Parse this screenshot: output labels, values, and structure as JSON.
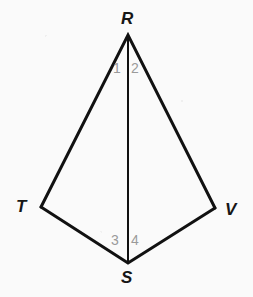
{
  "figure": {
    "background_color": "#fafafa",
    "stroke_color": "#111111",
    "angle_label_color": "#9a9a9a",
    "vertex_label_color": "#161616",
    "stroke_width": 3,
    "diagonal_stroke_width": 2,
    "vertices": [
      {
        "name": "R",
        "label": "R",
        "x": 128,
        "y": 35
      },
      {
        "name": "T",
        "label": "T",
        "x": 41,
        "y": 207
      },
      {
        "name": "V",
        "label": "V",
        "x": 215,
        "y": 208
      },
      {
        "name": "S",
        "label": "S",
        "x": 128,
        "y": 263
      }
    ],
    "edges": [
      {
        "name": "segment-RT",
        "from": "R",
        "to": "T"
      },
      {
        "name": "segment-RV",
        "from": "R",
        "to": "V"
      },
      {
        "name": "segment-TS",
        "from": "T",
        "to": "S"
      },
      {
        "name": "segment-SV",
        "from": "S",
        "to": "V"
      },
      {
        "name": "segment-RS-diagonal",
        "from": "R",
        "to": "S"
      }
    ],
    "vertex_labels": {
      "R": "R",
      "T": "T",
      "V": "V",
      "S": "S"
    },
    "angle_labels": {
      "one": "1",
      "two": "2",
      "three": "3",
      "four": "4"
    }
  }
}
